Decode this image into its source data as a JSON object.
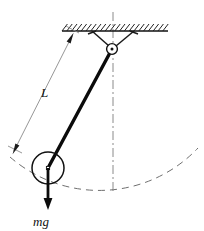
{
  "figure": {
    "name": "simple-pendulum-free-body-diagram",
    "domain": "Diagram",
    "background_color": "#ffffff",
    "width": 204,
    "height": 231
  },
  "labels": {
    "length_label": "L",
    "weight_label": "mg"
  },
  "colors": {
    "ink": "#111111",
    "rod": "#0b0b0b",
    "dimension_line": "#8a8a8a",
    "center_line": "#8a8a8a",
    "arc": "#6f6f6f",
    "hatch": "#222222",
    "support_line": "#1a1a1a"
  },
  "geometry": {
    "ceiling": {
      "x1": 62,
      "x2": 168,
      "y": 31,
      "hatch_count": 22,
      "hatch_length": 9,
      "hatch_angle_deg": 45
    },
    "pivot": {
      "cx": 112,
      "cy": 49,
      "outer_radius": 5.2,
      "inner_radius": 1.6
    },
    "support_bracket": {
      "left_anchor_x": 92,
      "right_anchor_x": 134,
      "anchor_y": 31
    },
    "rod": {
      "x1": 112,
      "y1": 49,
      "x2": 48,
      "y2": 168,
      "stroke_width": 3.2
    },
    "bob": {
      "cx": 48,
      "cy": 168,
      "radius": 16,
      "center_marker_size": 3
    },
    "weight_arrow": {
      "x": 48,
      "y1": 168,
      "y2": 208,
      "stroke_width": 2.6,
      "head_width": 8,
      "head_length": 9
    },
    "length_dimension": {
      "x1": 72,
      "y1": 36,
      "x2": 14,
      "y2": 152,
      "arrow_head_length": 7,
      "arrow_head_width": 4,
      "tick_top": {
        "x1": 66,
        "y1": 27,
        "x2": 78,
        "y2": 33
      },
      "tick_bottom": {
        "x1": 8,
        "y1": 147,
        "x2": 22,
        "y2": 154
      }
    },
    "center_line": {
      "x": 113,
      "y1": 12,
      "y2": 191,
      "dash": "9,3,2,3"
    },
    "swing_arc": {
      "pivot_x": 112,
      "pivot_y": 49,
      "radius": 135,
      "start_x": 10,
      "start_y": 157,
      "end_x": 198,
      "end_y": 148,
      "dash": "7,5"
    },
    "label_positions": {
      "L": {
        "x": 41,
        "y": 97
      },
      "mg": {
        "x": 33,
        "y": 226
      }
    }
  }
}
